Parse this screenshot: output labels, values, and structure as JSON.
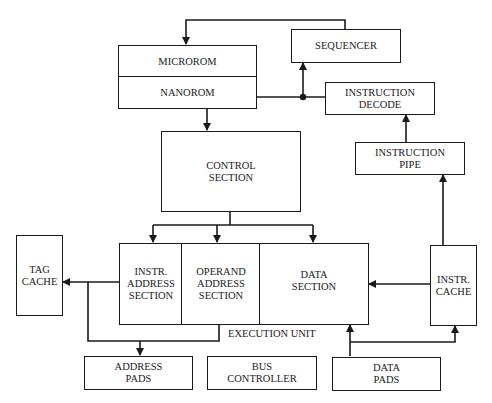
{
  "diagram": {
    "title": "",
    "colors": {
      "line": "#1a1a1a",
      "text": "#222222",
      "background": "#ffffff"
    },
    "blocks": {
      "microrom": "MICROROM",
      "nanorom": "NANOROM",
      "sequencer": "SEQUENCER",
      "instruction_decode": "INSTRUCTION\nDECODE",
      "instruction_pipe": "INSTRUCTION\nPIPE",
      "control_section": "CONTROL\nSECTION",
      "tag_cache": "TAG\nCACHE",
      "instr_address_section": "INSTR.\nADDRESS\nSECTION",
      "operand_address_section": "OPERAND\nADDRESS\nSECTION",
      "data_section": "DATA\nSECTION",
      "instr_cache": "INSTR.\nCACHE",
      "address_pads": "ADDRESS\nPADS",
      "bus_controller": "BUS\nCONTROLLER",
      "data_pads": "DATA\nPADS"
    },
    "group_labels": {
      "execution_unit": "EXECUTION UNIT"
    },
    "connections": [
      {
        "from": "sequencer",
        "to": "microrom"
      },
      {
        "from": "nanorom",
        "to": "sequencer"
      },
      {
        "from": "instruction_decode",
        "to": "sequencer"
      },
      {
        "from": "nanorom",
        "to": "control_section"
      },
      {
        "from": "instruction_pipe",
        "to": "instruction_decode"
      },
      {
        "from": "instr_cache",
        "to": "instruction_pipe"
      },
      {
        "from": "control_section",
        "to": "instr_address_section"
      },
      {
        "from": "control_section",
        "to": "operand_address_section"
      },
      {
        "from": "control_section",
        "to": "data_section"
      },
      {
        "from": "instr_address_section",
        "to": "tag_cache"
      },
      {
        "from": "execution_unit",
        "to": "address_pads"
      },
      {
        "from": "instr_cache",
        "to": "data_section"
      },
      {
        "from": "data_pads",
        "to": "data_section"
      },
      {
        "from": "data_pads",
        "to": "instr_cache"
      }
    ]
  }
}
